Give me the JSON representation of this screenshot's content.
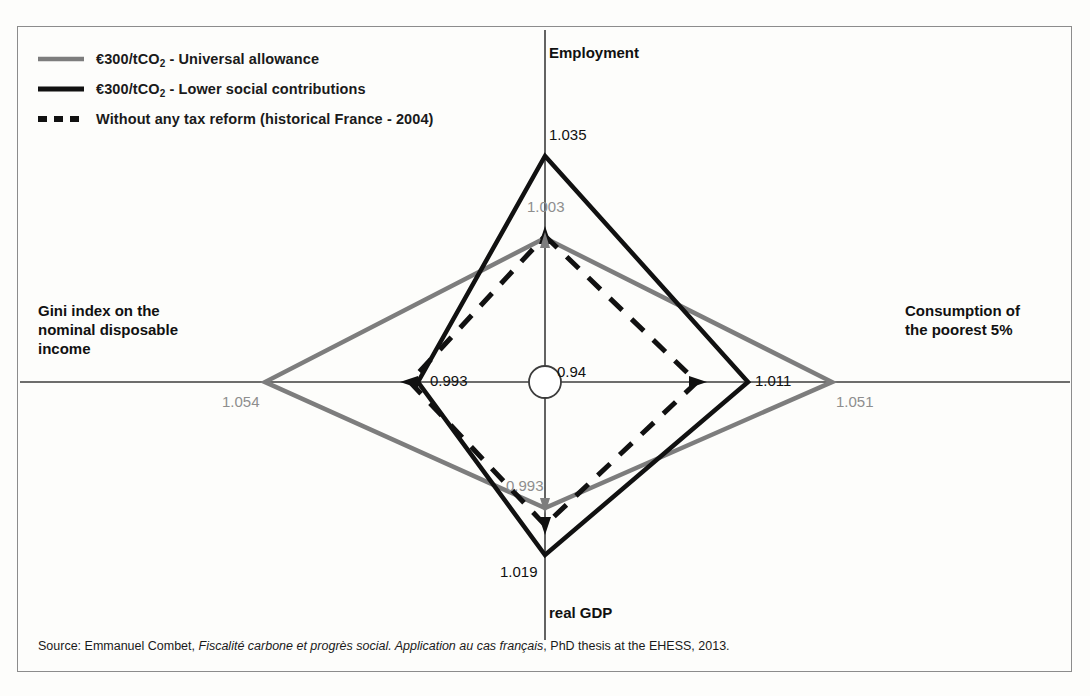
{
  "legend": {
    "items": [
      {
        "label_pre": "€300/tCO",
        "label_sub": "2",
        "label_post": " - Universal allowance",
        "style": "solid",
        "color": "#7d7d7d"
      },
      {
        "label_pre": "€300/tCO",
        "label_sub": "2",
        "label_post": " - Lower social contributions",
        "style": "solid",
        "color": "#111111"
      },
      {
        "label_pre": "",
        "label_sub": "",
        "label_post": "Without any tax reform (historical France - 2004)",
        "style": "dashed",
        "color": "#111111"
      }
    ]
  },
  "axes_labels": {
    "top": "Employment",
    "right_line1": "Consumption of",
    "right_line2": "the poorest 5%",
    "left_line1": "Gini index on the",
    "left_line2": "nominal disposable",
    "left_line3": "income",
    "bottom": "real GDP"
  },
  "center_value": "0.94",
  "values": {
    "employment_black": "1.035",
    "employment_gray": "1.003",
    "consumption_black": "1.011",
    "consumption_gray": "1.051",
    "gini_black": "0.993",
    "gini_gray": "1.054",
    "gdp_black": "1.019",
    "gdp_gray": "0.993"
  },
  "source": {
    "prefix": "Source: Emmanuel Combet, ",
    "italic": "Fiscalité carbone et progrès social. Application au cas français",
    "suffix": ", PhD thesis at the EHESS, 2013."
  },
  "chart_data": {
    "type": "radar",
    "title": "",
    "axes": [
      "Employment",
      "Consumption of the poorest 5%",
      "real GDP",
      "Gini index on the nominal disposable income"
    ],
    "center": 0.94,
    "series": [
      {
        "name": "€300/tCO2 - Universal allowance",
        "color": "#7d7d7d",
        "style": "solid",
        "values": [
          1.003,
          1.051,
          0.993,
          1.054
        ],
        "labels": [
          "1.003",
          "1.051",
          "0.993",
          "1.054"
        ]
      },
      {
        "name": "€300/tCO2 - Lower social contributions",
        "color": "#111111",
        "style": "solid",
        "values": [
          1.035,
          1.011,
          1.019,
          0.993
        ],
        "labels": [
          "1.035",
          "1.011",
          "1.019",
          "0.993"
        ]
      },
      {
        "name": "Without any tax reform (historical France - 2004)",
        "color": "#111111",
        "style": "dashed",
        "values": [
          1.0,
          1.0,
          1.0,
          1.0
        ],
        "labels": [
          "",
          "",
          "",
          ""
        ]
      }
    ],
    "legend_position": "top-left",
    "grid": false
  },
  "geometry": {
    "cx": 545,
    "cy": 382,
    "gray": {
      "top": 238,
      "right": 832,
      "bottom": 508,
      "left": 265
    },
    "black": {
      "top": 156,
      "right": 748,
      "bottom": 555,
      "left": 418
    },
    "dashed": {
      "top": 236,
      "right": 697,
      "bottom": 525,
      "left": 410
    },
    "axis_top": 30,
    "axis_bottom": 640,
    "axis_left": 20,
    "axis_right": 1070
  }
}
